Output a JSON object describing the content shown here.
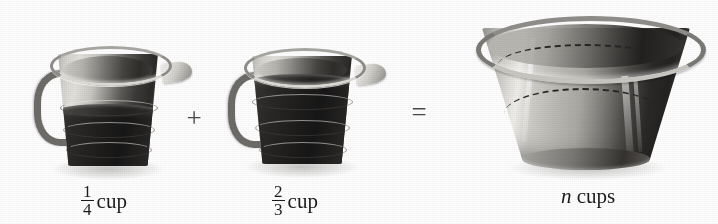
{
  "figure": {
    "type": "illustration",
    "background_color": "#fefefe",
    "ink_color": "#1b1b1b"
  },
  "operators": {
    "plus": "+",
    "equals": "="
  },
  "items": [
    {
      "name": "measuring-cup-one",
      "icon": "measuring-cup-icon",
      "fill_fraction_numerator": "1",
      "fill_fraction_denominator": "4",
      "unit": "cup",
      "label_text": "1/4 cup"
    },
    {
      "name": "measuring-cup-two",
      "icon": "measuring-cup-icon",
      "fill_fraction_numerator": "2",
      "fill_fraction_denominator": "3",
      "unit": "cup",
      "label_text": "2/3 cup"
    },
    {
      "name": "mixing-bowl",
      "icon": "mixing-bowl-icon",
      "variable": "n",
      "unit": "cups",
      "label_text": "n cups"
    }
  ]
}
